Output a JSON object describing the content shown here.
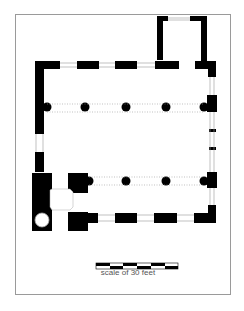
{
  "diagram": {
    "type": "architectural floor plan",
    "scale_label": "scale of 30 feet",
    "scale_segments": 6,
    "colors": {
      "wall": "#000000",
      "frame": "#9a9a9a",
      "background": "#ffffff",
      "text": "#555555"
    },
    "columns_row1": 5,
    "columns_row2": 4
  }
}
